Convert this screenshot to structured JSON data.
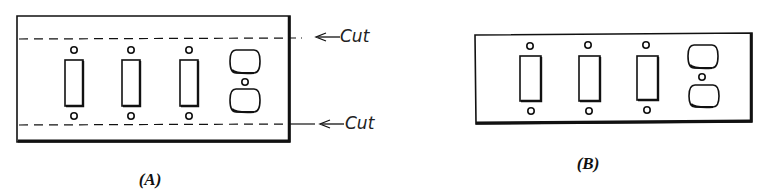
{
  "figure": {
    "panel_a": {
      "label": "(A)",
      "cut_labels": [
        "Cut",
        "Cut"
      ],
      "devices": [
        "toggle-switch",
        "toggle-switch",
        "toggle-switch",
        "duplex-outlet"
      ]
    },
    "panel_b": {
      "label": "(B)",
      "devices": [
        "toggle-switch",
        "toggle-switch",
        "toggle-switch",
        "duplex-outlet"
      ]
    }
  },
  "colors": {
    "line": "#111111",
    "background": "#ffffff"
  }
}
